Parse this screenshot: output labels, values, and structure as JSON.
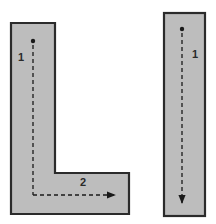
{
  "diagram": {
    "colors": {
      "fill": "#bdbdbd",
      "stroke": "#2b2b2b",
      "path": "#1a1a1a",
      "background": "#ffffff"
    },
    "shapes": [
      {
        "id": "l-shape",
        "kind": "L-shaped room",
        "segments": [
          {
            "label": "1",
            "direction": "down"
          },
          {
            "label": "2",
            "direction": "right"
          }
        ]
      },
      {
        "id": "i-shape",
        "kind": "rectangular room",
        "segments": [
          {
            "label": "1",
            "direction": "down"
          }
        ]
      }
    ]
  }
}
